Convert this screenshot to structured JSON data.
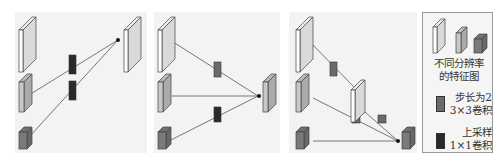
{
  "diagram": {
    "panels": [
      {
        "id": "a",
        "description": "upsampling fusion: lower-level maps pass through 1x1 conv up-sampling to top map"
      },
      {
        "id": "b",
        "description": "fusion to middle map: top via stride-2 3x3 conv, middle direct, bottom via 1x1 up-sampling conv"
      },
      {
        "id": "c",
        "description": "fusion to bottom map: top via stride-2 conv to intermediate map, intermediate and middle via stride-2 conv, bottom direct"
      }
    ],
    "colors": {
      "high_res_map": "#ffffff",
      "mid_res_map": "#c8c8c8",
      "low_res_map": "#7a7a7a",
      "stride_conv": "#6a6a6a",
      "upsample_conv": "#2a2a2a",
      "panel_bg": "#f3f3f3",
      "line": "#555555"
    }
  },
  "legend": {
    "feature_maps_label_line1": "不同分辨率",
    "feature_maps_label_line2": "的特征图",
    "stride_conv_label_line1": "步长为2",
    "stride_conv_label_line2": "3×3卷积",
    "upsample_conv_label_line1": "上采样",
    "upsample_conv_label_line2": "1×1卷积"
  }
}
